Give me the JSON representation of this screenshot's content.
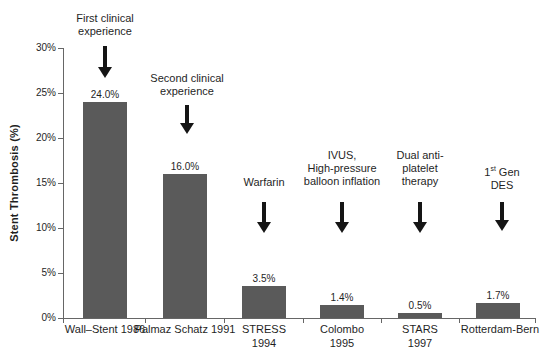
{
  "chart_data": {
    "type": "bar",
    "title": "",
    "ylabel": "Stent Thrombosis (%)",
    "xlabel": "",
    "ylim": [
      0,
      30
    ],
    "ytick_step": 5,
    "yticks": [
      "0%",
      "5%",
      "10%",
      "15%",
      "20%",
      "25%",
      "30%"
    ],
    "grid": false,
    "legend": "none",
    "bar_color": "#5a5a5a",
    "categories": [
      "Wall–Stent 1986",
      "Palmaz Schatz 1991",
      "STRESS 1994",
      "Colombo 1995",
      "STARS 1997",
      "Rotterdam-Bern"
    ],
    "values": [
      24.0,
      16.0,
      3.5,
      1.4,
      0.5,
      1.7
    ],
    "value_labels": [
      "24.0%",
      "16.0%",
      "3.5%",
      "1.4%",
      "0.5%",
      "1.7%"
    ],
    "annotations": [
      {
        "target": "Wall–Stent 1986",
        "text": "First clinical experience"
      },
      {
        "target": "Palmaz Schatz 1991",
        "text": "Second clinical experience"
      },
      {
        "target": "STRESS 1994",
        "text": "Warfarin"
      },
      {
        "target": "Colombo 1995",
        "text": "IVUS, High-pressure balloon inflation"
      },
      {
        "target": "STARS 1997",
        "text": "Dual anti-platelet therapy"
      },
      {
        "target": "Rotterdam-Bern",
        "text": "1st Gen DES"
      }
    ]
  },
  "category_labels": [
    {
      "lines": [
        "Wall–Stent 1986"
      ]
    },
    {
      "lines": [
        "Palmaz Schatz 1991"
      ]
    },
    {
      "lines": [
        "STRESS",
        "1994"
      ]
    },
    {
      "lines": [
        "Colombo",
        "1995"
      ]
    },
    {
      "lines": [
        "STARS",
        "1997"
      ]
    },
    {
      "lines": [
        "Rotterdam-Bern"
      ]
    }
  ],
  "annotation_labels": [
    {
      "lines": [
        "First clinical",
        "experience"
      ]
    },
    {
      "lines": [
        "Second clinical",
        "experience"
      ]
    },
    {
      "lines": [
        "Warfarin"
      ]
    },
    {
      "lines": [
        "IVUS,",
        "High-pressure",
        "balloon inflation"
      ]
    },
    {
      "lines": [
        "Dual anti-",
        "platelet",
        "therapy"
      ]
    },
    {
      "line1_pre": "1",
      "line1_sup": "st",
      "line1_rest": " Gen",
      "line2": "DES"
    }
  ]
}
